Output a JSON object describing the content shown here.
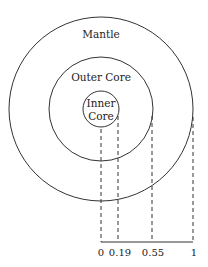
{
  "diagram": {
    "type": "concentric-circles",
    "layers": [
      {
        "name": "Mantle",
        "radius_fraction": 1
      },
      {
        "name": "Outer Core",
        "radius_fraction": 0.55
      },
      {
        "name": "Inner Core",
        "radius_fraction": 0.19
      }
    ],
    "labels": {
      "mantle": "Mantle",
      "outer_core": "Outer Core",
      "inner_core_line1": "Inner",
      "inner_core_line2": "Core"
    },
    "axis": {
      "ticks": [
        "0",
        "0.19",
        "0.55",
        "1"
      ]
    }
  }
}
